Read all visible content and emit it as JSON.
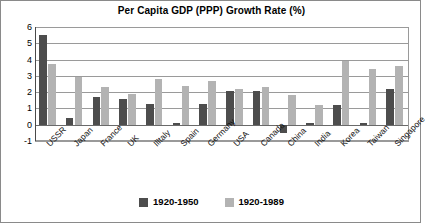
{
  "chart_data": {
    "type": "bar",
    "title": "Per Capita GDP (PPP) Growth Rate (%)",
    "xlabel": "",
    "ylabel": "",
    "ylim": [
      -1,
      6
    ],
    "yticks": [
      6,
      5,
      4,
      3,
      2,
      1,
      0,
      -1
    ],
    "ytick_labels": [
      "6",
      "5",
      "4",
      "3",
      "2",
      "1",
      "0",
      "-1"
    ],
    "grid": true,
    "legend_position": "bottom",
    "categories": [
      "USSR",
      "Japan",
      "France",
      "UK",
      "Illtaly",
      "Spain",
      "Germany",
      "USA",
      "Canada",
      "China",
      "India",
      "Korea",
      "Taiwan",
      "Singapore"
    ],
    "series": [
      {
        "name": "1920-1950",
        "color": "#4d4d4d",
        "values": [
          5.5,
          0.4,
          1.7,
          1.6,
          1.3,
          0.1,
          1.3,
          2.1,
          2.1,
          -0.5,
          0.1,
          1.2,
          0.1,
          2.2
        ]
      },
      {
        "name": "1920-1989",
        "color": "#b3b3b3",
        "values": [
          3.7,
          2.9,
          2.3,
          1.9,
          2.8,
          2.4,
          2.7,
          2.2,
          2.3,
          1.8,
          1.2,
          3.9,
          3.4,
          3.6
        ]
      }
    ]
  },
  "legend": {
    "entries": [
      {
        "label": "1920-1950",
        "swatch": "dark-swatch"
      },
      {
        "label": "1920-1989",
        "swatch": "light-swatch"
      }
    ]
  }
}
